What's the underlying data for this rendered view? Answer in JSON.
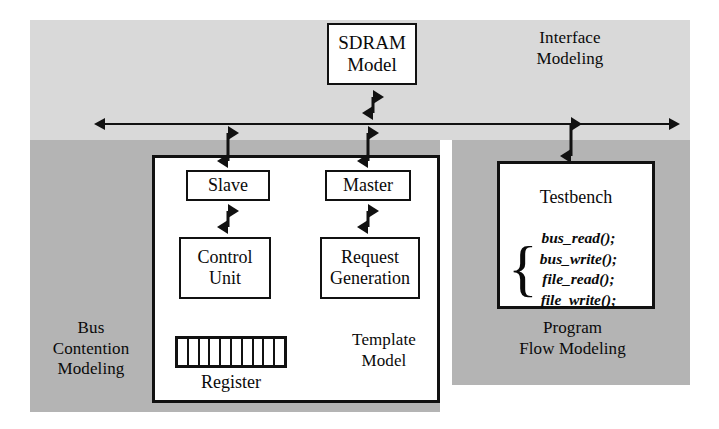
{
  "diagram": {
    "zones": {
      "interface": {
        "label": "Interface\nModeling",
        "color": "#d9d9d9"
      },
      "bus_contention": {
        "label": "Bus\nContention\nModeling",
        "color": "#b4b4b4"
      },
      "program_flow": {
        "label": "Program\nFlow Modeling",
        "color": "#b4b4b4"
      }
    },
    "boxes": {
      "sdram": {
        "label": "SDRAM\nModel"
      },
      "template": {
        "label": "Template\nModel"
      },
      "slave": {
        "label": "Slave"
      },
      "master": {
        "label": "Master"
      },
      "control_unit": {
        "label": "Control\nUnit"
      },
      "request_generation": {
        "label": "Request\nGeneration"
      },
      "register": {
        "label": "Register",
        "cells": 10
      },
      "testbench": {
        "title": "Testbench",
        "brace": "{",
        "calls": [
          "bus_read();",
          "bus_write();",
          "file_read();",
          "file_write();"
        ]
      }
    },
    "connections": {
      "bus": {
        "name": "system-bus",
        "style": "double-headed-horizontal"
      },
      "sdram_to_bus": {
        "style": "double-headed-vertical"
      },
      "bus_to_slave": {
        "style": "double-headed-vertical"
      },
      "bus_to_master": {
        "style": "double-headed-vertical"
      },
      "bus_to_testbench": {
        "style": "double-headed-vertical"
      },
      "slave_to_control": {
        "style": "double-headed-vertical"
      },
      "master_to_request": {
        "style": "double-headed-vertical"
      }
    }
  }
}
